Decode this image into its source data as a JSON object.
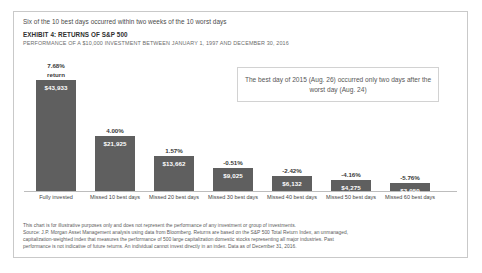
{
  "header": {
    "kicker": "Six of the 10 best days occurred within two weeks of the 10 worst days",
    "exhibit": "EXHIBIT 4: RETURNS OF S&P 500",
    "performance": "PERFORMANCE OF A $10,000 INVESTMENT BETWEEN JANUARY 1, 1997 AND DECEMBER 30, 2016"
  },
  "callout": {
    "text": "The best day of 2015 (Aug. 26) occurred only two days after the worst day (Aug. 24)"
  },
  "footnote": {
    "line1": "This chart is for illustrative purposes only and does not represent the performance of any investment or group of investments.",
    "line2": "Source: J.P. Morgan Asset Management analysis using data from Bloomberg. Returns are based on the S&P 500 Total Return Index, an unmanaged,",
    "line3": "capitalization-weighted index that measures the performance of 500 large capitalization domestic stocks representing all major industries. Past",
    "line4": "performance is not indicative of future returns. An individual cannot invest directly in an index. Data as of December 31, 2016."
  },
  "chart_data": {
    "type": "bar",
    "title": "EXHIBIT 4: RETURNS OF S&P 500",
    "subtitle": "PERFORMANCE OF A $10,000 INVESTMENT BETWEEN JANUARY 1, 1997 AND DECEMBER 30, 2016",
    "xlabel": "",
    "ylabel": "",
    "grid": false,
    "legend": "none",
    "ylim": [
      0,
      43933
    ],
    "bar_color": "#5f5f5f",
    "categories": [
      "Fully invested",
      "Missed 10 best days",
      "Missed 20 best days",
      "Missed 30 best days",
      "Missed 40 best days",
      "Missed 50 best days",
      "Missed 60 best days"
    ],
    "values": [
      43933,
      21925,
      13662,
      9025,
      6132,
      4275,
      3050
    ],
    "value_labels": [
      "$43,933",
      "$21,925",
      "$13,662",
      "$9,025",
      "$6,132",
      "$4,275",
      "$3,050"
    ],
    "annualized_returns": [
      7.68,
      4.0,
      1.57,
      -0.51,
      -2.42,
      -4.16,
      -5.76
    ],
    "return_labels": [
      "7.68%",
      "4.00%",
      "1.57%",
      "-0.51%",
      "-2.42%",
      "-4.16%",
      "-5.76%"
    ],
    "first_bar_sublabel": "return"
  }
}
